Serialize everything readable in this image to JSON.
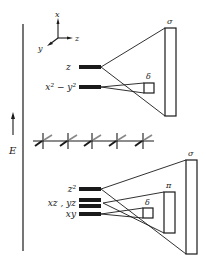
{
  "diagram": {
    "energy_axis": {
      "label": "E"
    },
    "coordinate_axes": {
      "x": "x",
      "y": "y",
      "z": "z"
    },
    "top_panel": {
      "orbitals": [
        {
          "label": "z",
          "y": 67
        },
        {
          "label": "x² − y²",
          "y": 87
        }
      ],
      "overlap_boxes": [
        {
          "label": "σ",
          "x": 165,
          "y": 28,
          "w": 11,
          "h": 88
        },
        {
          "label": "δ",
          "x": 144,
          "y": 83,
          "w": 10,
          "h": 10
        }
      ]
    },
    "crystal_row": {
      "count": 5
    },
    "bottom_panel": {
      "orbitals": [
        {
          "label": "z²",
          "y": 189
        },
        {
          "label": "xz , yz",
          "y": 203
        },
        {
          "label": "xy",
          "y": 214
        }
      ],
      "overlap_boxes": [
        {
          "label": "σ",
          "x": 186,
          "y": 160,
          "w": 11,
          "h": 94
        },
        {
          "label": "π",
          "x": 164,
          "y": 192,
          "w": 11,
          "h": 41
        },
        {
          "label": "δ",
          "x": 143,
          "y": 208,
          "w": 10,
          "h": 10
        }
      ]
    },
    "colors": {
      "ink": "#1a1a1a",
      "background": "#ffffff"
    }
  }
}
